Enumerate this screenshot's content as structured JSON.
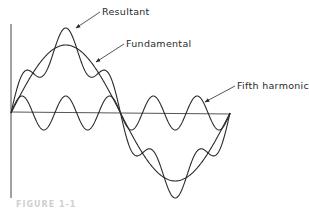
{
  "figure": {
    "labels": {
      "resultant": "Resultant",
      "fundamental": "Fundamental",
      "fifth_harmonic": "Fifth harmonic"
    },
    "caption": "FIGURE 1-1",
    "colors": {
      "line": "#2a2a2a",
      "background": "#ffffff"
    }
  },
  "chart_data": {
    "type": "line",
    "title": "",
    "xlabel": "",
    "ylabel": "",
    "series": [
      {
        "name": "Fundamental",
        "function": "sin(x)",
        "amplitude": 1.0,
        "cycles": 1
      },
      {
        "name": "Fifth harmonic",
        "function": "0.25*sin(5x)",
        "amplitude": 0.25,
        "cycles": 5
      },
      {
        "name": "Resultant",
        "function": "sin(x) + 0.25*sin(5x)",
        "amplitude": 1.25,
        "cycles": 1
      }
    ],
    "x_range": [
      0,
      6.283
    ],
    "grid": false
  }
}
